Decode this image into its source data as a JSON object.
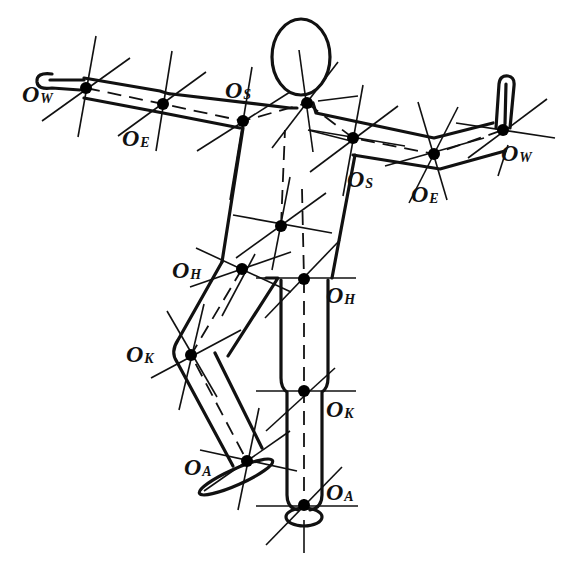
{
  "diagram": {
    "type": "human-body-joint-model",
    "stroke_color": "#111111",
    "background": "#ffffff",
    "joints": [
      {
        "id": "left-wrist",
        "label": "O",
        "sub": "W",
        "x": 86,
        "y": 88,
        "label_x": 22,
        "label_y": 82
      },
      {
        "id": "left-elbow",
        "label": "O",
        "sub": "E",
        "x": 163,
        "y": 104,
        "label_x": 122,
        "label_y": 126
      },
      {
        "id": "left-shoulder",
        "label": "O",
        "sub": "S",
        "x": 243,
        "y": 121,
        "label_x": 225,
        "label_y": 78
      },
      {
        "id": "neck",
        "label": "",
        "sub": "",
        "x": 307,
        "y": 103
      },
      {
        "id": "right-shoulder",
        "label": "O",
        "sub": "S",
        "x": 353,
        "y": 138,
        "label_x": 347,
        "label_y": 167
      },
      {
        "id": "right-elbow",
        "label": "O",
        "sub": "E",
        "x": 434,
        "y": 154,
        "label_x": 411,
        "label_y": 182
      },
      {
        "id": "right-wrist",
        "label": "O",
        "sub": "W",
        "x": 503,
        "y": 130,
        "label_x": 501,
        "label_y": 141
      },
      {
        "id": "torso-center",
        "label": "",
        "sub": "",
        "x": 281,
        "y": 226
      },
      {
        "id": "left-hip",
        "label": "O",
        "sub": "H",
        "x": 242,
        "y": 269,
        "label_x": 172,
        "label_y": 258
      },
      {
        "id": "right-hip",
        "label": "O",
        "sub": "H",
        "x": 304,
        "y": 279,
        "label_x": 326,
        "label_y": 283
      },
      {
        "id": "left-knee",
        "label": "O",
        "sub": "K",
        "x": 191,
        "y": 355,
        "label_x": 126,
        "label_y": 342
      },
      {
        "id": "left-ankle",
        "label": "O",
        "sub": "A",
        "x": 247,
        "y": 461,
        "label_x": 184,
        "label_y": 455
      },
      {
        "id": "right-knee",
        "label": "O",
        "sub": "K",
        "x": 304,
        "y": 391,
        "label_x": 326,
        "label_y": 397
      },
      {
        "id": "right-ankle",
        "label": "O",
        "sub": "A",
        "x": 304,
        "y": 505,
        "label_x": 326,
        "label_y": 480
      }
    ]
  }
}
